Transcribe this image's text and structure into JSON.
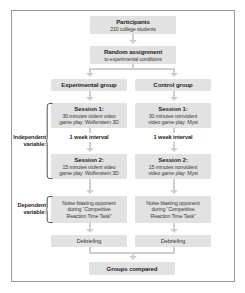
{
  "figure": {
    "name": "experimental-design-flowchart",
    "frame_border_color": "#9a9a9a",
    "box_fill_color": "#e2e2e2",
    "connector_color": "#cfcfcf"
  },
  "nodes": {
    "participants": {
      "title": "Participants",
      "subtitle": "210 college students"
    },
    "random_assignment": {
      "title": "Random assignment",
      "subtitle": "to experimental conditions"
    },
    "experimental_group": {
      "title": "Experimental group"
    },
    "control_group": {
      "title": "Control group"
    },
    "exp_session1": {
      "title": "Session 1:",
      "subtitle_line1": "30 minutes violent video",
      "subtitle_line2": "game play: Wolfenstein 3D"
    },
    "ctl_session1": {
      "title": "Session 1:",
      "subtitle_line1": "30 minutes nonviolent",
      "subtitle_line2": "video game play: Myst"
    },
    "exp_interval": {
      "label": "1 week interval"
    },
    "ctl_interval": {
      "label": "1 week interval"
    },
    "exp_session2": {
      "title": "Session 2:",
      "subtitle_line1": "15 minutes violent video",
      "subtitle_line2": "game play: Wolfenstein 3D"
    },
    "ctl_session2": {
      "title": "Session 2:",
      "subtitle_line1": "15 minutes nonviolent",
      "subtitle_line2": "video game play: Myst"
    },
    "exp_dependent": {
      "line1": "Noise blasting opponent",
      "line2": "during “Competitive",
      "line3": "Reaction Time Task”"
    },
    "ctl_dependent": {
      "line1": "Noise blasting opponent",
      "line2": "during “Competitive",
      "line3": "Reaction Time Task”"
    },
    "exp_debriefing": {
      "label": "Debriefing"
    },
    "ctl_debriefing": {
      "label": "Debriefing"
    },
    "groups_compared": {
      "title": "Groups compared"
    }
  },
  "side_labels": {
    "independent": {
      "line1": "Independent",
      "line2": "variable:"
    },
    "dependent": {
      "line1": "Dependent",
      "line2": "variable:"
    }
  }
}
